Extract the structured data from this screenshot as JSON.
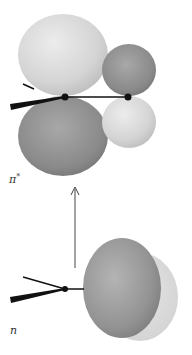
{
  "diagram": {
    "type": "molecular-orbital-transition",
    "upper_orbital": {
      "label": "π",
      "label_superscript": "*",
      "lobes": [
        {
          "position": "upper-left",
          "shade": "light",
          "color": "#d6d6d6"
        },
        {
          "position": "upper-right",
          "shade": "dark",
          "color": "#8e8e8e"
        },
        {
          "position": "lower-left",
          "shade": "dark",
          "color": "#8a8a8a"
        },
        {
          "position": "lower-right",
          "shade": "light",
          "color": "#d2d2d2"
        }
      ],
      "atoms": 2
    },
    "lower_orbital": {
      "label": "n",
      "lobes": [
        {
          "position": "front",
          "shade": "dark",
          "color": "#959595"
        },
        {
          "position": "back",
          "shade": "light",
          "color": "#dcdcdc"
        }
      ],
      "atoms": 1
    },
    "transition_arrow": {
      "direction": "up",
      "from": "n",
      "to": "π*",
      "color": "#444444"
    },
    "colors": {
      "background": "#ffffff",
      "bond": "#111111",
      "atom": "#111111"
    }
  }
}
